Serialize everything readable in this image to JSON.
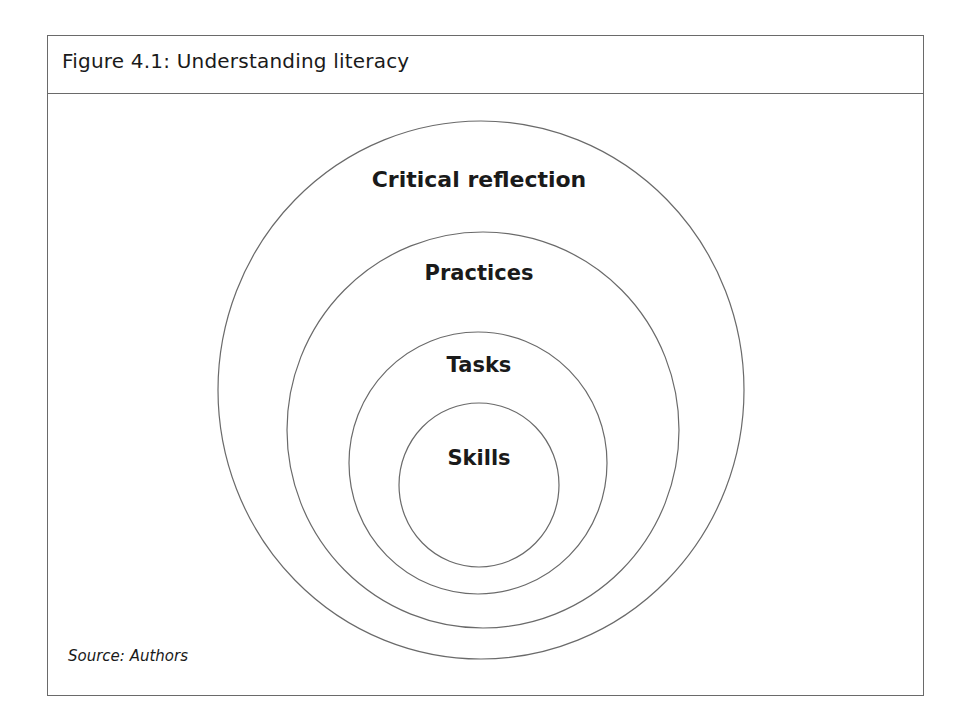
{
  "figure": {
    "title": "Figure 4.1: Understanding literacy",
    "source": "Source: Authors"
  },
  "diagram": {
    "type": "nested-circles",
    "rings": [
      {
        "label": "Critical reflection",
        "level": 1
      },
      {
        "label": "Practices",
        "level": 2
      },
      {
        "label": "Tasks",
        "level": 3
      },
      {
        "label": "Skills",
        "level": 4
      }
    ]
  },
  "colors": {
    "line": "#6a6a6a",
    "text": "#1a1a1a",
    "background": "#ffffff"
  }
}
